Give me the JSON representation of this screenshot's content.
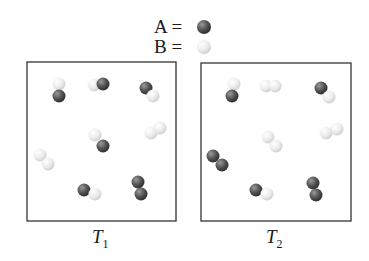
{
  "legend": {
    "a_label": "A =",
    "b_label": "B =",
    "a_color": "#5a5a5a",
    "b_color": "#e6e6e6"
  },
  "boxes": [
    {
      "label": "T",
      "subscript": "1",
      "rect": [
        27,
        62,
        149,
        159
      ],
      "atoms": [
        {
          "t": "B",
          "x": 59,
          "y": 84
        },
        {
          "t": "A",
          "x": 59,
          "y": 96
        },
        {
          "t": "B",
          "x": 94,
          "y": 85
        },
        {
          "t": "A",
          "x": 103,
          "y": 84
        },
        {
          "t": "A",
          "x": 146,
          "y": 88
        },
        {
          "t": "B",
          "x": 153,
          "y": 96
        },
        {
          "t": "B",
          "x": 95,
          "y": 135
        },
        {
          "t": "A",
          "x": 103,
          "y": 146
        },
        {
          "t": "B",
          "x": 151,
          "y": 133
        },
        {
          "t": "B",
          "x": 160,
          "y": 128
        },
        {
          "t": "B",
          "x": 40,
          "y": 155
        },
        {
          "t": "B",
          "x": 48,
          "y": 164
        },
        {
          "t": "A",
          "x": 84,
          "y": 190
        },
        {
          "t": "B",
          "x": 95,
          "y": 194
        },
        {
          "t": "A",
          "x": 138,
          "y": 182
        },
        {
          "t": "A",
          "x": 141,
          "y": 194
        }
      ]
    },
    {
      "label": "T",
      "subscript": "2",
      "rect": [
        201,
        63,
        150,
        158
      ],
      "atoms": [
        {
          "t": "B",
          "x": 234,
          "y": 84
        },
        {
          "t": "A",
          "x": 232,
          "y": 96
        },
        {
          "t": "B",
          "x": 266,
          "y": 86
        },
        {
          "t": "B",
          "x": 275,
          "y": 86
        },
        {
          "t": "A",
          "x": 321,
          "y": 88
        },
        {
          "t": "B",
          "x": 329,
          "y": 97
        },
        {
          "t": "B",
          "x": 268,
          "y": 137
        },
        {
          "t": "B",
          "x": 276,
          "y": 146
        },
        {
          "t": "B",
          "x": 326,
          "y": 133
        },
        {
          "t": "B",
          "x": 337,
          "y": 129
        },
        {
          "t": "A",
          "x": 213,
          "y": 156
        },
        {
          "t": "A",
          "x": 222,
          "y": 165
        },
        {
          "t": "A",
          "x": 256,
          "y": 190
        },
        {
          "t": "B",
          "x": 267,
          "y": 194
        },
        {
          "t": "A",
          "x": 313,
          "y": 183
        },
        {
          "t": "A",
          "x": 316,
          "y": 195
        }
      ]
    }
  ]
}
